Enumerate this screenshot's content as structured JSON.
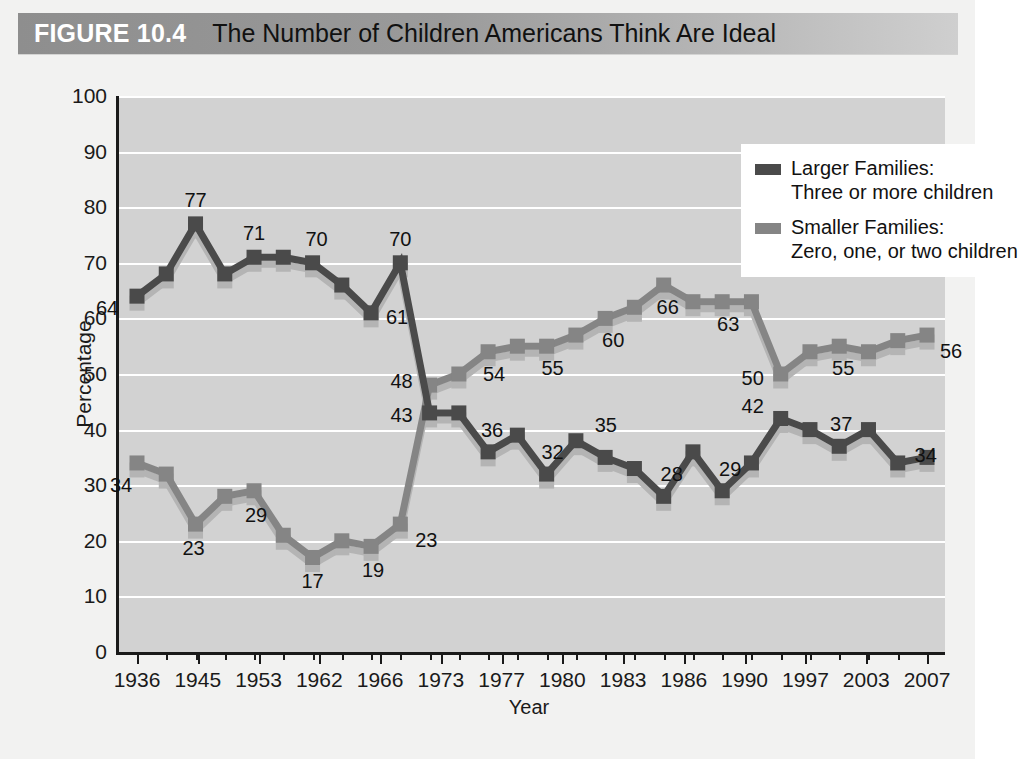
{
  "header": {
    "figure_tag": "FIGURE 10.4",
    "title": "The Number of Children Americans Think Are Ideal"
  },
  "colors": {
    "larger_families": "#4a4a4a",
    "smaller_families": "#858585",
    "shadow": "#b4b4b4",
    "plot_background": "#d2d2d2",
    "gridline": "#ffffff",
    "axis": "#1a1a1a",
    "band_left": "#8e8e8e",
    "band_right": "#cfcfcf"
  },
  "legend": {
    "position": "top-right",
    "entries": [
      {
        "swatch": "#4a4a4a",
        "line1": "Larger Families:",
        "line2": "Three or more children"
      },
      {
        "swatch": "#858585",
        "line1": "Smaller Families:",
        "line2": "Zero, one, or two children"
      }
    ]
  },
  "chart_data": {
    "type": "line",
    "title": "The Number of Children Americans Think Are Ideal",
    "xlabel": "Year",
    "ylabel": "Percentage",
    "ylim": [
      0,
      100
    ],
    "ytick_step": 10,
    "yticks": [
      0,
      10,
      20,
      30,
      40,
      50,
      60,
      70,
      80,
      90,
      100
    ],
    "grid": true,
    "xtick_labels": [
      "1936",
      "1945",
      "1953",
      "1962",
      "1966",
      "1973",
      "1977",
      "1980",
      "1983",
      "1986",
      "1990",
      "1997",
      "2003",
      "2007"
    ],
    "n_points": 28,
    "series": [
      {
        "name": "Larger Families: Three or more children",
        "color": "#4a4a4a",
        "values": [
          64,
          68,
          77,
          68,
          71,
          71,
          70,
          66,
          61,
          70,
          43,
          43,
          36,
          39,
          32,
          38,
          35,
          33,
          28,
          36,
          29,
          34,
          42,
          40,
          37,
          40,
          34,
          35
        ]
      },
      {
        "name": "Smaller Families: Zero, one, or two children",
        "color": "#858585",
        "values": [
          34,
          32,
          23,
          28,
          29,
          21,
          17,
          20,
          19,
          23,
          48,
          50,
          54,
          55,
          55,
          57,
          60,
          62,
          66,
          63,
          63,
          63,
          50,
          54,
          55,
          54,
          56,
          57
        ]
      }
    ],
    "annotations": [
      {
        "series": "larger",
        "index": 0,
        "value": 64,
        "text": "64",
        "dx": -30,
        "dy": 12
      },
      {
        "series": "larger",
        "index": 2,
        "value": 77,
        "text": "77",
        "dx": 0,
        "dy": -24
      },
      {
        "series": "larger",
        "index": 4,
        "value": 71,
        "text": "71",
        "dx": 0,
        "dy": -24
      },
      {
        "series": "larger",
        "index": 6,
        "value": 70,
        "text": "70",
        "dx": 4,
        "dy": -24
      },
      {
        "series": "larger",
        "index": 8,
        "value": 61,
        "text": "61",
        "dx": 26,
        "dy": 4
      },
      {
        "series": "larger",
        "index": 9,
        "value": 70,
        "text": "70",
        "dx": 0,
        "dy": -24
      },
      {
        "series": "larger",
        "index": 10,
        "value": 43,
        "text": "43",
        "dx": -28,
        "dy": 2
      },
      {
        "series": "larger",
        "index": 12,
        "value": 36,
        "text": "36",
        "dx": 4,
        "dy": -22
      },
      {
        "series": "larger",
        "index": 14,
        "value": 32,
        "text": "32",
        "dx": 6,
        "dy": -22
      },
      {
        "series": "larger",
        "index": 15,
        "value": 38,
        "text": "35",
        "dx": 30,
        "dy": -16
      },
      {
        "series": "larger",
        "index": 18,
        "value": 28,
        "text": "28",
        "dx": 8,
        "dy": -22
      },
      {
        "series": "larger",
        "index": 20,
        "value": 29,
        "text": "29",
        "dx": 8,
        "dy": -22
      },
      {
        "series": "larger",
        "index": 22,
        "value": 42,
        "text": "42",
        "dx": -28,
        "dy": -12
      },
      {
        "series": "larger",
        "index": 24,
        "value": 37,
        "text": "37",
        "dx": 2,
        "dy": -22
      },
      {
        "series": "larger",
        "index": 26,
        "value": 34,
        "text": "34",
        "dx": 28,
        "dy": -8
      },
      {
        "series": "smaller",
        "index": 0,
        "value": 34,
        "text": "34",
        "dx": -16,
        "dy": 22
      },
      {
        "series": "smaller",
        "index": 2,
        "value": 23,
        "text": "23",
        "dx": -2,
        "dy": 24
      },
      {
        "series": "smaller",
        "index": 4,
        "value": 29,
        "text": "29",
        "dx": 2,
        "dy": 24
      },
      {
        "series": "smaller",
        "index": 6,
        "value": 17,
        "text": "17",
        "dx": 0,
        "dy": 24
      },
      {
        "series": "smaller",
        "index": 8,
        "value": 19,
        "text": "19",
        "dx": 2,
        "dy": 24
      },
      {
        "series": "smaller",
        "index": 9,
        "value": 23,
        "text": "23",
        "dx": 26,
        "dy": 16
      },
      {
        "series": "smaller",
        "index": 10,
        "value": 48,
        "text": "48",
        "dx": -28,
        "dy": -4
      },
      {
        "series": "smaller",
        "index": 12,
        "value": 54,
        "text": "54",
        "dx": 6,
        "dy": 22
      },
      {
        "series": "smaller",
        "index": 14,
        "value": 55,
        "text": "55",
        "dx": 6,
        "dy": 22
      },
      {
        "series": "smaller",
        "index": 16,
        "value": 60,
        "text": "60",
        "dx": 8,
        "dy": 22
      },
      {
        "series": "smaller",
        "index": 18,
        "value": 66,
        "text": "66",
        "dx": 4,
        "dy": 22
      },
      {
        "series": "smaller",
        "index": 20,
        "value": 63,
        "text": "63",
        "dx": 6,
        "dy": 22
      },
      {
        "series": "smaller",
        "index": 22,
        "value": 50,
        "text": "50",
        "dx": -28,
        "dy": 4
      },
      {
        "series": "smaller",
        "index": 24,
        "value": 55,
        "text": "55",
        "dx": 4,
        "dy": 22
      },
      {
        "series": "smaller",
        "index": 27,
        "value": 57,
        "text": "56",
        "dx": 24,
        "dy": 16
      }
    ]
  }
}
